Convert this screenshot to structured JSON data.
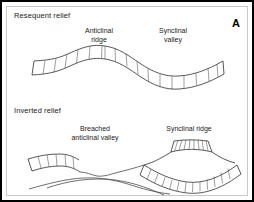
{
  "figure": {
    "letter": "A"
  },
  "panels": [
    {
      "id": "resequent",
      "title": "Resequent relief",
      "labels": [
        {
          "name": "anticlinal-ridge",
          "line1": "Anticlinal",
          "line2": "ridge"
        },
        {
          "name": "synclinal-valley",
          "line1": "Synclinal",
          "line2": "valley"
        }
      ]
    },
    {
      "id": "inverted",
      "title": "Inverted relief",
      "labels": [
        {
          "name": "breached-anticlinal-valley",
          "line1": "Breached",
          "line2": "anticlinal valley"
        },
        {
          "name": "synclinal-ridge",
          "line1": "Synclinal ridge",
          "line2": ""
        }
      ]
    }
  ],
  "style": {
    "border_color": "#000000",
    "stratum_color": "#3a3a3a",
    "tick_color": "#5a5a5a",
    "background": "#ffffff",
    "text_color": "#1a1a1a"
  }
}
